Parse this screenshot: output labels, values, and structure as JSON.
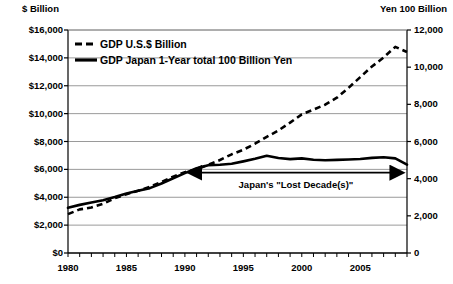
{
  "chart_data": {
    "type": "line",
    "title": "",
    "xlabel": "",
    "ylabel": "$ Billion",
    "y2label": "Yen 100 Billion",
    "left_axis": {
      "label": "$ Billion",
      "min": 0,
      "max": 16000,
      "step": 2000,
      "ticks": [
        "$0",
        "$2,000",
        "$4,000",
        "$6,000",
        "$8,000",
        "$10,000",
        "$12,000",
        "$14,000",
        "$16,000"
      ],
      "tick_values": [
        0,
        2000,
        4000,
        6000,
        8000,
        10000,
        12000,
        14000,
        16000
      ]
    },
    "right_axis": {
      "label": "Yen 100 Billion",
      "min": 0,
      "max": 12000,
      "step": 2000,
      "ticks": [
        "0",
        "2,000",
        "4,000",
        "6,000",
        "8,000",
        "10,000",
        "12,000"
      ],
      "tick_values": [
        0,
        2000,
        4000,
        6000,
        8000,
        10000,
        12000
      ]
    },
    "x_axis": {
      "min": 1980,
      "max": 2009,
      "tick_step": 1,
      "label_step": 5,
      "labels": [
        "1980",
        "1985",
        "1990",
        "1995",
        "2000",
        "2005"
      ],
      "label_values": [
        1980,
        1985,
        1990,
        1995,
        2000,
        2005
      ]
    },
    "grid": "horizontal",
    "legend_position": "top-left-inside",
    "x": [
      1980,
      1981,
      1982,
      1983,
      1984,
      1985,
      1986,
      1987,
      1988,
      1989,
      1990,
      1991,
      1992,
      1993,
      1994,
      1995,
      1996,
      1997,
      1998,
      1999,
      2000,
      2001,
      2002,
      2003,
      2004,
      2005,
      2006,
      2007,
      2008,
      2009
    ],
    "series": [
      {
        "name": "GDP U.S.$ Billion",
        "axis": "left",
        "style": "dashed",
        "values": [
          2790,
          3130,
          3260,
          3530,
          3930,
          4220,
          4460,
          4740,
          5100,
          5480,
          5800,
          5990,
          6340,
          6670,
          7080,
          7410,
          7840,
          8330,
          8790,
          9350,
          9950,
          10290,
          10640,
          11140,
          11850,
          12620,
          13380,
          14030,
          14790,
          14420
        ]
      },
      {
        "name": "GDP Japan 1-Year total 100 Billion Yen",
        "axis": "right",
        "style": "solid",
        "values": [
          2430,
          2590,
          2720,
          2840,
          3010,
          3200,
          3350,
          3490,
          3740,
          4020,
          4300,
          4560,
          4720,
          4750,
          4800,
          4930,
          5070,
          5230,
          5110,
          5050,
          5090,
          5020,
          4990,
          5010,
          5030,
          5060,
          5120,
          5150,
          5090,
          4750
        ]
      }
    ],
    "annotations": [
      {
        "name": "lost-decade",
        "text": "Japan's \"Lost Decade(s)\"",
        "arrow": "double",
        "x_start": 1991,
        "x_end": 2008,
        "y_value_right_axis": 4000
      }
    ]
  },
  "legend": {
    "items": [
      {
        "label": "GDP U.S.$ Billion",
        "style": "dashed"
      },
      {
        "label": "GDP Japan 1-Year total 100 Billion Yen",
        "style": "solid"
      }
    ]
  },
  "colors": {
    "line": "#000000",
    "grid": "#808080",
    "axis": "#000000",
    "background": "#ffffff"
  }
}
